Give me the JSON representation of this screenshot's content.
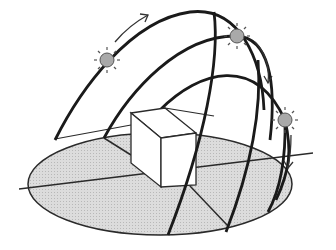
{
  "diagram": {
    "colors": {
      "background": "#ffffff",
      "ground_fill": "#d6d6d6",
      "line": "#1e1e1e",
      "sun_fill": "#a9a9a9",
      "box_fill": "#ffffff"
    },
    "suns": [
      {
        "name": "sun-morning",
        "cx": 107,
        "cy": 60
      },
      {
        "name": "sun-noon",
        "cx": 237,
        "cy": 36
      },
      {
        "name": "sun-evening",
        "cx": 285,
        "cy": 120
      }
    ],
    "arrows": [
      {
        "name": "arrow-rising",
        "direction": "up-right"
      },
      {
        "name": "arrow-descending",
        "direction": "down"
      },
      {
        "name": "arrow-setting",
        "direction": "down"
      }
    ]
  }
}
